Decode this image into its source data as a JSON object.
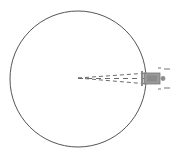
{
  "figure": {
    "title": "Circle with dashed beam cone and object at rim",
    "type": "line-diagram",
    "canvas": {
      "width": 179,
      "height": 160,
      "background": "#ffffff"
    },
    "colors": {
      "circle_stroke": "#555555",
      "dash_stroke": "#6b6b6b",
      "object_fill": "#9a9a9a",
      "object_stroke": "#767676",
      "tick_stroke": "#8a8a8a",
      "dot_fill": "#8f8f8f"
    },
    "circle": {
      "name": "boundary-circle",
      "center_x": 78,
      "center_y": 79,
      "radius": 68,
      "stroke_width": 1,
      "fill": "none"
    },
    "beam": {
      "name": "dashed-beam-cone",
      "apex_x": 78,
      "apex_y": 78,
      "end_x": 148,
      "upper_end_y": 73,
      "lower_end_y": 84,
      "dash_pattern": "4 3",
      "stroke_width": 1,
      "half_angle_deg": 4.5
    },
    "axis_line": {
      "name": "beam-center-axis",
      "x1": 78,
      "y1": 78.5,
      "x2": 150,
      "y2": 78.5,
      "dash_pattern": "5 4"
    },
    "object": {
      "name": "vehicle-object",
      "x": 144,
      "y": 73,
      "width": 16,
      "height": 11,
      "label": "",
      "nose_dot": {
        "cx": 163,
        "cy": 78.5,
        "r": 2.4
      },
      "tail_bar": {
        "x": 141,
        "y": 71,
        "width": 2,
        "height": 15
      }
    },
    "tick_marks": [
      {
        "name": "tick-upper-right",
        "x1": 164,
        "y1": 69,
        "x2": 170,
        "y2": 69
      },
      {
        "name": "tick-lower-right",
        "x1": 164,
        "y1": 88,
        "x2": 170,
        "y2": 88
      },
      {
        "name": "tick-upper-inner",
        "x1": 158,
        "y1": 68,
        "x2": 161,
        "y2": 68
      },
      {
        "name": "tick-lower-inner",
        "x1": 158,
        "y1": 89,
        "x2": 161,
        "y2": 89
      }
    ],
    "annotations": []
  }
}
